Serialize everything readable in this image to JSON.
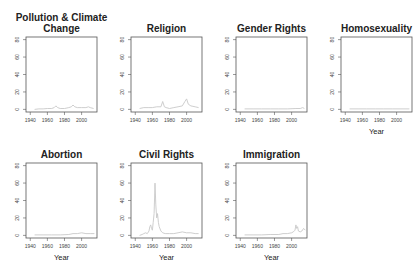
{
  "figure": {
    "layout": {
      "rows": 2,
      "cols": 4
    },
    "colors": {
      "line": "#c8c8c8",
      "frame": "#555555",
      "text": "#222222",
      "tick_text": "#444444"
    }
  },
  "chart_data": [
    {
      "type": "line",
      "title": "Pollution & Climate Change",
      "title_lines": [
        "Pollution & Climate",
        "Change"
      ],
      "xlabel": "",
      "ylabel": "",
      "xlim": [
        1935,
        2018
      ],
      "ylim": [
        -3,
        83
      ],
      "xticks": [
        1940,
        1960,
        1980,
        2000
      ],
      "yticks": [
        0,
        20,
        40,
        60,
        80
      ],
      "grid": false,
      "x": [
        1945,
        1950,
        1955,
        1960,
        1965,
        1968,
        1970,
        1972,
        1975,
        1980,
        1985,
        1988,
        1990,
        1992,
        1995,
        2000,
        2005,
        2008,
        2010,
        2014
      ],
      "values": [
        0,
        0.5,
        0.5,
        1,
        1,
        2,
        4,
        2,
        1,
        1,
        2,
        3,
        5,
        3,
        2,
        2,
        2,
        3,
        2,
        1
      ]
    },
    {
      "type": "line",
      "title": "Religion",
      "title_lines": [
        "Religion"
      ],
      "xlabel": "",
      "ylabel": "",
      "xlim": [
        1935,
        2018
      ],
      "ylim": [
        -3,
        83
      ],
      "xticks": [
        1940,
        1960,
        1980,
        2000
      ],
      "yticks": [
        0,
        20,
        40,
        60,
        80
      ],
      "grid": false,
      "x": [
        1945,
        1950,
        1955,
        1960,
        1965,
        1970,
        1972,
        1974,
        1976,
        1980,
        1985,
        1990,
        1995,
        1998,
        2000,
        2002,
        2005,
        2010,
        2014
      ],
      "values": [
        1,
        2,
        2,
        2,
        3,
        3,
        9,
        3,
        2,
        1,
        2,
        3,
        4,
        9,
        12,
        6,
        4,
        3,
        2
      ]
    },
    {
      "type": "line",
      "title": "Gender Rights",
      "title_lines": [
        "Gender Rights"
      ],
      "xlabel": "",
      "ylabel": "",
      "xlim": [
        1935,
        2018
      ],
      "ylim": [
        -3,
        83
      ],
      "xticks": [
        1940,
        1960,
        1980,
        2000
      ],
      "yticks": [
        0,
        20,
        40,
        60,
        80
      ],
      "grid": false,
      "x": [
        1945,
        1955,
        1965,
        1975,
        1985,
        1995,
        2005,
        2010,
        2013,
        2015
      ],
      "values": [
        0.5,
        0.5,
        0.5,
        0.5,
        0.5,
        0.5,
        1,
        1,
        2,
        1
      ]
    },
    {
      "type": "line",
      "title": "Homosexuality",
      "title_lines": [
        "Homosexuality"
      ],
      "xlabel": "Year",
      "ylabel": "",
      "xlim": [
        1935,
        2018
      ],
      "ylim": [
        -3,
        83
      ],
      "xticks": [
        1940,
        1960,
        1980,
        2000
      ],
      "yticks": [
        0,
        20,
        40,
        60,
        80
      ],
      "grid": false,
      "x": [
        1945,
        1955,
        1965,
        1975,
        1985,
        1995,
        2005,
        2015
      ],
      "values": [
        0.5,
        0.5,
        0.5,
        0.5,
        0.5,
        0.5,
        0.5,
        0.5
      ]
    },
    {
      "type": "line",
      "title": "Abortion",
      "title_lines": [
        "Abortion"
      ],
      "xlabel": "Year",
      "ylabel": "",
      "xlim": [
        1935,
        2018
      ],
      "ylim": [
        -3,
        83
      ],
      "xticks": [
        1940,
        1960,
        1980,
        2000
      ],
      "yticks": [
        0,
        20,
        40,
        60,
        80
      ],
      "grid": false,
      "x": [
        1945,
        1955,
        1965,
        1975,
        1985,
        1990,
        1995,
        2000,
        2005,
        2010,
        2015
      ],
      "values": [
        0.5,
        0.5,
        0.5,
        0.5,
        1,
        2,
        2,
        3,
        2,
        2,
        2
      ]
    },
    {
      "type": "line",
      "title": "Civil Rights",
      "title_lines": [
        "Civil Rights"
      ],
      "xlabel": "Year",
      "ylabel": "",
      "xlim": [
        1935,
        2018
      ],
      "ylim": [
        -3,
        83
      ],
      "xticks": [
        1940,
        1960,
        1980,
        2000
      ],
      "yticks": [
        0,
        20,
        40,
        60,
        80
      ],
      "grid": false,
      "x": [
        1945,
        1948,
        1950,
        1952,
        1954,
        1956,
        1957,
        1958,
        1959,
        1960,
        1961,
        1962,
        1963,
        1964,
        1965,
        1966,
        1967,
        1968,
        1970,
        1972,
        1975,
        1980,
        1985,
        1990,
        1995,
        2000,
        2005,
        2010,
        2014
      ],
      "values": [
        0,
        1,
        2,
        3,
        2,
        5,
        10,
        12,
        8,
        6,
        15,
        25,
        60,
        35,
        20,
        25,
        15,
        10,
        5,
        3,
        2,
        2,
        2,
        3,
        4,
        3,
        3,
        2,
        2
      ]
    },
    {
      "type": "line",
      "title": "Immigration",
      "title_lines": [
        "Immigration"
      ],
      "xlabel": "Year",
      "ylabel": "",
      "xlim": [
        1935,
        2018
      ],
      "ylim": [
        -3,
        83
      ],
      "xticks": [
        1940,
        1960,
        1980,
        2000
      ],
      "yticks": [
        0,
        20,
        40,
        60,
        80
      ],
      "grid": false,
      "x": [
        1945,
        1955,
        1965,
        1975,
        1985,
        1990,
        1995,
        2000,
        2002,
        2004,
        2005,
        2006,
        2007,
        2008,
        2010,
        2012,
        2014,
        2016
      ],
      "values": [
        0.5,
        0.5,
        0.5,
        1,
        1,
        2,
        2,
        3,
        4,
        6,
        12,
        8,
        10,
        5,
        4,
        5,
        8,
        6
      ]
    }
  ]
}
